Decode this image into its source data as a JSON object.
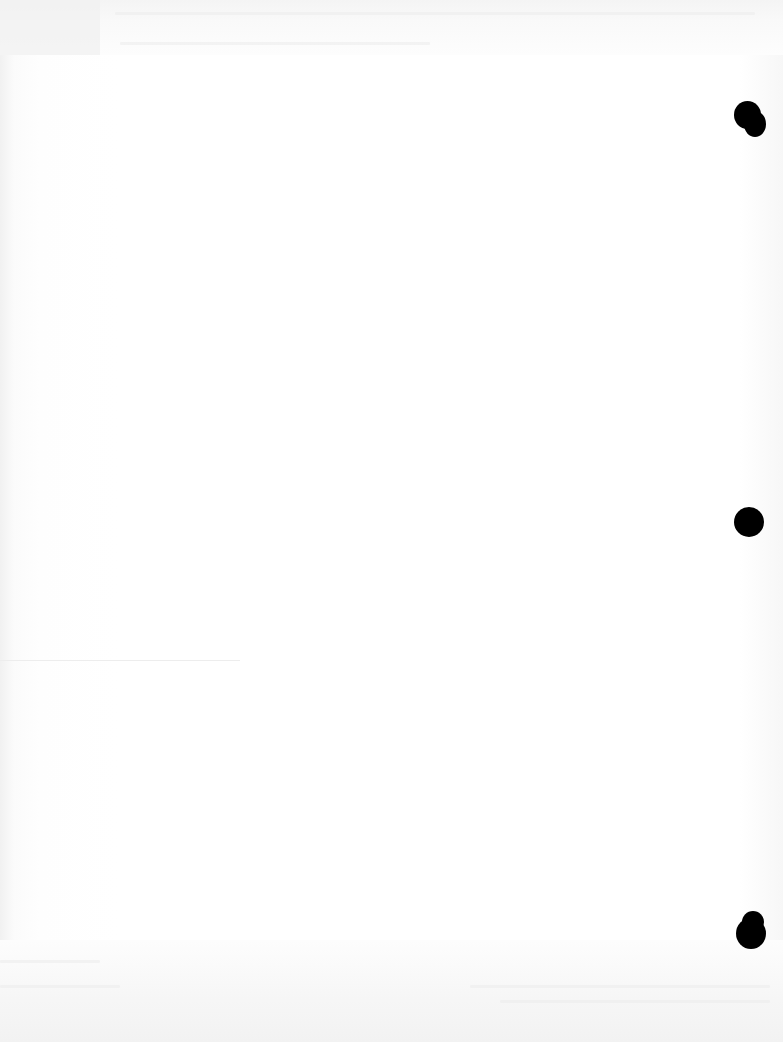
{
  "document": {
    "type": "scanned blank page",
    "visible_text": "",
    "punch_holes": [
      {
        "position": "top-right",
        "x": 748,
        "y": 117
      },
      {
        "position": "middle-right",
        "x": 749,
        "y": 522
      },
      {
        "position": "bottom-right",
        "x": 750,
        "y": 930
      }
    ],
    "colors": {
      "paper": "#ffffff",
      "hole": "#000000",
      "bleed_through": "#ececec"
    }
  }
}
